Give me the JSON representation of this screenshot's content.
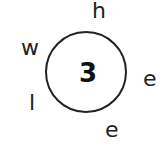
{
  "puzzle": {
    "center_number": "3",
    "letters": [
      {
        "char": "h",
        "x": 92,
        "y": 0
      },
      {
        "char": "w",
        "x": 21,
        "y": 37
      },
      {
        "char": "e",
        "x": 143,
        "y": 68
      },
      {
        "char": "l",
        "x": 29,
        "y": 92
      },
      {
        "char": "e",
        "x": 105,
        "y": 119
      }
    ]
  }
}
